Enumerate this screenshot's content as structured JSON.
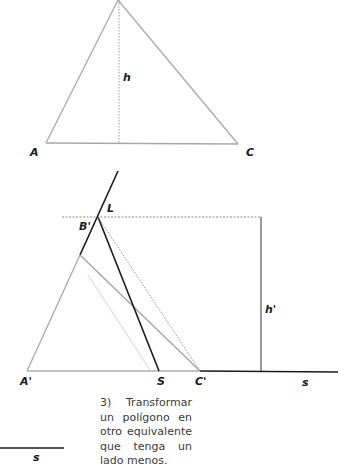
{
  "figure_top": {
    "labels": {
      "A": "A",
      "C": "C",
      "h": "h"
    }
  },
  "figure_bottom": {
    "labels": {
      "L": "L",
      "B_prime": "B'",
      "A_prime": "A'",
      "S": "S",
      "C_prime": "C'",
      "h_prime": "h'",
      "s": "s"
    }
  },
  "segment_s": {
    "label": "s"
  },
  "caption": {
    "text": "3) Transformar un polígono en otro equivalente que tenga un lado menos."
  },
  "colors": {
    "black": "#1a1a1a",
    "grey": "#a8a8a8",
    "light_grey": "#d6d6d6",
    "dotted": "#8a8a8a"
  }
}
